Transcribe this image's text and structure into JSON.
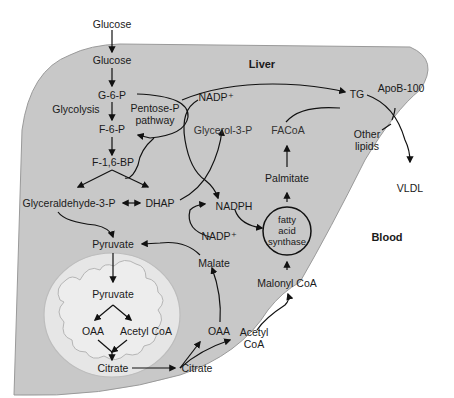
{
  "regions": {
    "liver": "Liver",
    "blood": "Blood"
  },
  "labels": {
    "glucose_blood": "Glucose",
    "glucose_liver": "Glucose",
    "g6p": "G-6-P",
    "glycolysis": "Glycolysis",
    "pentose_pathway": "Pentose-P\npathway",
    "f6p": "F-6-P",
    "f16bp": "F-1,6-BP",
    "glyceraldehyde3p": "Glyceraldehyde-3-P",
    "dhap": "DHAP",
    "pyruvate_cyto": "Pyruvate",
    "pyruvate_mito": "Pyruvate",
    "oaa_mito": "OAA",
    "acetylcoa_mito": "Acetyl CoA",
    "citrate_mito": "Citrate",
    "citrate_cyto": "Citrate",
    "oaa_cyto": "OAA",
    "acetylcoa_cyto": "Acetyl\nCoA",
    "malate": "Malate",
    "nadp_top": "NADP⁺",
    "nadp_mid": "NADP⁺",
    "nadph": "NADPH",
    "glycerol3p": "Glycerol-3-P",
    "facoa": "FACoA",
    "palmitate": "Palmitate",
    "fatty_acid_synthase": "fatty\nacid\nsynthase",
    "malonylcoa": "Malonyl CoA",
    "tg": "TG",
    "apob100": "ApoB-100",
    "other_lipids": "Other\nlipids",
    "vldl": "VLDL"
  },
  "colors": {
    "liver_fill": "#c8c8c8",
    "liver_stroke": "#9a9a9a",
    "mito_fill": "#e4e4e4",
    "mito_inner": "#ececec",
    "line": "#111111"
  }
}
